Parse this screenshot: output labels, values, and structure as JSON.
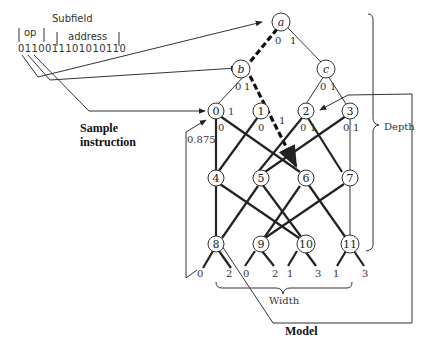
{
  "instruction": {
    "subfield_label": "Subfield",
    "op_label": "op",
    "address_label": "address",
    "bits": "0110011101010110",
    "sample_label_line1": "Sample",
    "sample_label_line2": "instruction"
  },
  "tree": {
    "nodes": [
      {
        "id": "a",
        "label": "a"
      },
      {
        "id": "b",
        "label": "b"
      },
      {
        "id": "c",
        "label": "c"
      }
    ],
    "edge_labels": {
      "a_0": "0",
      "a_1": "1",
      "b_0": "0",
      "b_1": "1",
      "c_0": "0",
      "c_1": "1"
    }
  },
  "network": {
    "nodes": [
      "0",
      "1",
      "2",
      "3",
      "4",
      "5",
      "6",
      "7",
      "8",
      "9",
      "10",
      "11"
    ],
    "edge_labels": {
      "n0_0": "0",
      "n0_1": "1",
      "n1_0": "0",
      "n1_1": "1",
      "n2_0": "0",
      "n2_1": "1",
      "n3_0": "0",
      "n3_1": "1"
    },
    "outputs": [
      "0",
      "2",
      "0",
      "2",
      "1",
      "3",
      "1",
      "3"
    ],
    "feedback_weight": "0.875"
  },
  "labels": {
    "depth": "Depth",
    "width": "Width",
    "model": "Model"
  }
}
